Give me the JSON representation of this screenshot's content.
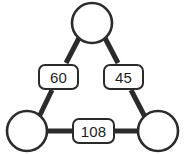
{
  "diagram": {
    "type": "triangle-graph",
    "background_color": "#ffffff",
    "stroke_color": "#2b2b2b",
    "node_fill_color": "#ffffff",
    "text_color": "#1d1d1d",
    "nodes": [
      {
        "id": "top",
        "label": "",
        "cx": 92,
        "cy": 23,
        "r": 20
      },
      {
        "id": "bottom-left",
        "label": "",
        "cx": 27,
        "cy": 131,
        "r": 20
      },
      {
        "id": "bottom-right",
        "label": "",
        "cx": 158,
        "cy": 131,
        "r": 20
      }
    ],
    "edges": [
      {
        "id": "left",
        "from": "top",
        "to": "bottom-left",
        "label": "60"
      },
      {
        "id": "right",
        "from": "top",
        "to": "bottom-right",
        "label": "45"
      },
      {
        "id": "bottom",
        "from": "bottom-left",
        "to": "bottom-right",
        "label": "108"
      }
    ]
  }
}
